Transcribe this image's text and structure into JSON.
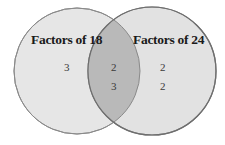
{
  "diagram": {
    "type": "venn",
    "sets": [
      {
        "label": "Factors of 18",
        "only_values": [
          "3"
        ],
        "fill": "#e6e6e6",
        "stroke": "#8a8a8a"
      },
      {
        "label": "Factors of 24",
        "only_values": [
          "2",
          "2"
        ],
        "fill": "#e2e2e2",
        "stroke": "#7a7a7a"
      }
    ],
    "intersection": {
      "values": [
        "2",
        "3"
      ],
      "fill": "#b9b9b9"
    }
  }
}
